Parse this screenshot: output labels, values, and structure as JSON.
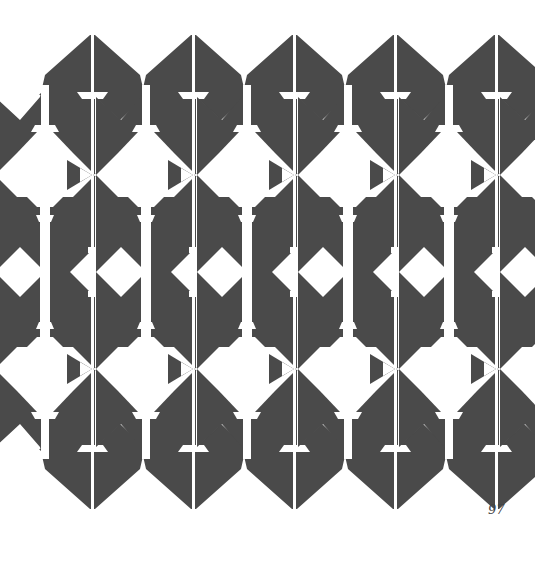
{
  "page": {
    "number": "97"
  },
  "pattern": {
    "fill_color": "#4a4a4a",
    "background_color": "#ffffff",
    "description": "Repeating symmetric geometric tribal-style motif"
  }
}
